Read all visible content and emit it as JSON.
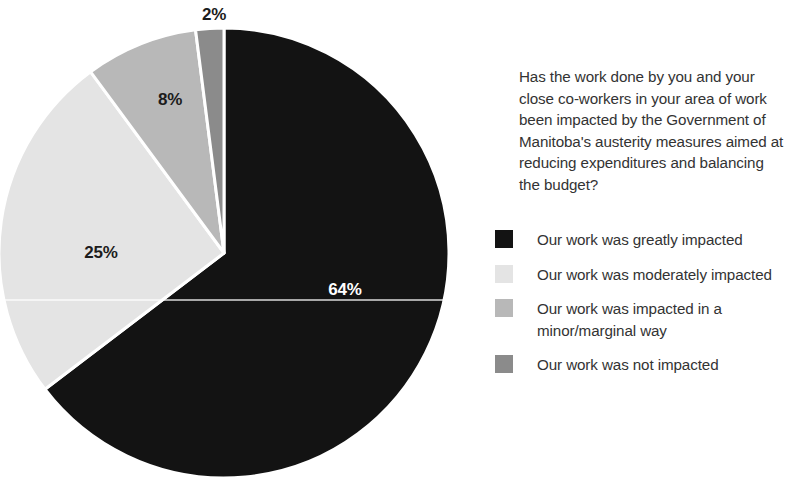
{
  "chart_data": {
    "type": "pie",
    "title": "",
    "question": "Has the work done by you and your close co-workers in your area of work been impacted by the Government of Manitoba's austerity measures aimed at reducing expenditures and balancing the budget?",
    "categories": [
      "Our work was greatly impacted",
      "Our work was moderately impacted",
      "Our work was impacted in a minor/marginal way",
      "Our work was not impacted"
    ],
    "values": [
      64,
      25,
      8,
      2
    ],
    "value_labels": [
      "64%",
      "25%",
      "8%",
      "2%"
    ],
    "colors": [
      "#131313",
      "#e4e4e4",
      "#b8b8b8",
      "#8b8b8b"
    ],
    "units": "percent",
    "start_angle_deg": 0,
    "direction": "clockwise",
    "legend_position": "right",
    "grid": false,
    "xlabel": "",
    "ylabel": ""
  },
  "pie": {
    "center_x": 224,
    "center_y": 253,
    "radius": 225,
    "separator_color": "#ffffff",
    "separator_width": 3,
    "label_positions": [
      {
        "label": "64%",
        "x": 345,
        "y": 295,
        "tone": "light"
      },
      {
        "label": "25%",
        "x": 101,
        "y": 258,
        "tone": "dark"
      },
      {
        "label": "8%",
        "x": 170,
        "y": 105,
        "tone": "dark"
      },
      {
        "label": "2%",
        "x": 214,
        "y": 20,
        "tone": "dark"
      }
    ]
  },
  "legend": {
    "items": [
      {
        "label": "Our work was greatly impacted",
        "color": "#131313"
      },
      {
        "label": "Our work was moderately impacted",
        "color": "#e4e4e4"
      },
      {
        "label": "Our work was impacted in a minor/marginal way",
        "color": "#b8b8b8"
      },
      {
        "label": "Our work was not impacted",
        "color": "#8b8b8b"
      }
    ]
  }
}
